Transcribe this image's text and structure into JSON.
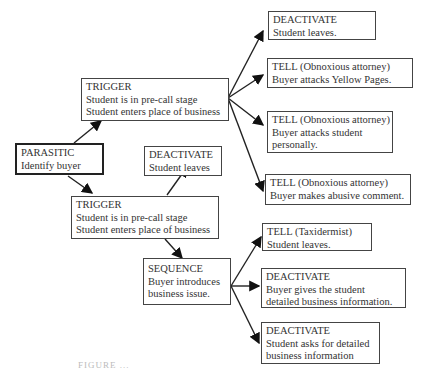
{
  "nodes": {
    "parasitic": {
      "type": "PARASITIC",
      "lines": [
        "Identify buyer"
      ]
    },
    "trigger1": {
      "type": "TRIGGER",
      "lines": [
        "Student is in pre-call stage",
        "Student enters place of business"
      ]
    },
    "deactivate1": {
      "type": "DEACTIVATE",
      "lines": [
        "Student leaves."
      ]
    },
    "tell1": {
      "type": "TELL (Obnoxious attorney)",
      "lines": [
        "Buyer attacks Yellow Pages."
      ]
    },
    "tell2": {
      "type": "TELL (Obnoxious attorney)",
      "lines": [
        "Buyer attacks student",
        "personally."
      ]
    },
    "tell3": {
      "type": "TELL (Obnoxious attorney)",
      "lines": [
        "Buyer makes abusive comment."
      ]
    },
    "deactivate2": {
      "type": "DEACTIVATE",
      "lines": [
        "Student leaves"
      ]
    },
    "trigger2": {
      "type": "TRIGGER",
      "lines": [
        "Student is in pre-call stage",
        "Student enters place of business"
      ]
    },
    "sequence": {
      "type": "SEQUENCE",
      "lines": [
        "Buyer introduces",
        "business issue."
      ]
    },
    "tell4": {
      "type": "TELL (Taxidermist)",
      "lines": [
        "Student leaves."
      ]
    },
    "deactivate3": {
      "type": "DEACTIVATE",
      "lines": [
        "Buyer gives the student",
        "detailed business information."
      ]
    },
    "deactivate4": {
      "type": "DEACTIVATE",
      "lines": [
        "Student asks for detailed",
        "business information"
      ]
    }
  },
  "caption": "FIGURE ..."
}
